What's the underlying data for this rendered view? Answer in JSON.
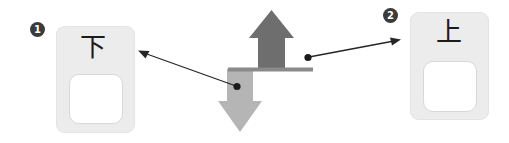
{
  "diagram": {
    "background_color": "#ffffff"
  },
  "badges": [
    {
      "id": "badge-1",
      "label": "1",
      "color": "#3b3b3b",
      "text_color": "#ffffff"
    },
    {
      "id": "badge-2",
      "label": "2",
      "color": "#3b3b3b",
      "text_color": "#ffffff"
    }
  ],
  "plates": [
    {
      "id": "plate-down",
      "glyph": "下",
      "meaning": "down",
      "badge": "1",
      "plate_color": "#ececec",
      "rocker_color": "#ffffff"
    },
    {
      "id": "plate-up",
      "glyph": "上",
      "meaning": "up",
      "badge": "2",
      "plate_color": "#ececec",
      "rocker_color": "#ffffff"
    }
  ],
  "arrows": {
    "up_arrow": {
      "name": "up-arrow",
      "direction": "up",
      "color": "#6e6e6e",
      "points_to_badge": "2"
    },
    "down_arrow": {
      "name": "down-arrow",
      "direction": "down",
      "color": "#b5b5b5",
      "points_to_badge": "1"
    },
    "divider_bar": {
      "name": "horizontal-divider-bar",
      "color": "#8a8a8a"
    }
  },
  "leader_lines": [
    {
      "id": "leader-line-left",
      "from_badge_dot": "down-arrow",
      "to_target": "plate-down",
      "color": "#262626"
    },
    {
      "id": "leader-line-right",
      "from_badge_dot": "up-arrow",
      "to_target": "plate-up",
      "color": "#262626"
    }
  ]
}
